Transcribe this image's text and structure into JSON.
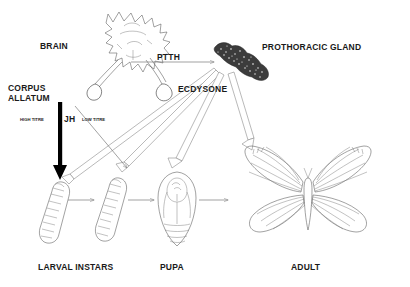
{
  "diagram": {
    "title_present": false,
    "background_color": "#ffffff",
    "ink_color": "#555555",
    "labels": {
      "brain": "BRAIN",
      "ptth": "PTTH",
      "prothoracic_gland": "PROTHORACIC GLAND",
      "ecdysone": "ECDYSONE",
      "corpus_allatum_line1": "CORPUS",
      "corpus_allatum_line2": "ALLATUM",
      "jh": "JH",
      "jh_high_titre": "HIGH TITRE",
      "jh_low_titre": "LOW TITRE",
      "larval_instars": "LARVAL INSTARS",
      "pupa": "PUPA",
      "adult": "ADULT"
    },
    "structures": [
      {
        "name": "brain",
        "type": "organ-drawing",
        "label": "BRAIN"
      },
      {
        "name": "prothoracic-gland",
        "type": "organ-drawing",
        "label": "PROTHORACIC GLAND"
      },
      {
        "name": "corpus-allatum",
        "type": "organ-drawing",
        "label": "CORPUS ALLATUM"
      }
    ],
    "life_stages": [
      {
        "name": "larva-1",
        "label": "LARVAL INSTARS"
      },
      {
        "name": "larva-2",
        "label": "LARVAL INSTARS"
      },
      {
        "name": "pupa",
        "label": "PUPA"
      },
      {
        "name": "adult",
        "label": "ADULT"
      }
    ],
    "hormone_arrows": [
      {
        "name": "ptth-arrow",
        "from": "brain",
        "to": "prothoracic-gland",
        "hormone": "PTTH",
        "style": "thin-line"
      },
      {
        "name": "ecdysone-arrow-larva-1",
        "from": "prothoracic-gland",
        "to": "larva-1",
        "hormone": "ECDYSONE",
        "style": "hollow"
      },
      {
        "name": "ecdysone-arrow-larva-2",
        "from": "prothoracic-gland",
        "to": "larva-2",
        "hormone": "ECDYSONE",
        "style": "hollow"
      },
      {
        "name": "ecdysone-arrow-pupa",
        "from": "prothoracic-gland",
        "to": "pupa",
        "hormone": "ECDYSONE",
        "style": "hollow"
      },
      {
        "name": "ecdysone-arrow-adult",
        "from": "prothoracic-gland",
        "to": "adult",
        "hormone": "ECDYSONE",
        "style": "hollow"
      },
      {
        "name": "jh-high-titre-arrow",
        "from": "corpus-allatum",
        "to": "larva-1",
        "hormone": "JH",
        "style": "thick-black",
        "titre": "HIGH TITRE"
      },
      {
        "name": "jh-low-titre-arrow",
        "from": "corpus-allatum",
        "to": "larva-2",
        "hormone": "JH",
        "style": "thin-line",
        "titre": "LOW TITRE"
      }
    ],
    "development_arrows": [
      {
        "name": "develop-larva1-to-larva2",
        "from": "larva-1",
        "to": "larva-2"
      },
      {
        "name": "develop-larva2-to-pupa",
        "from": "larva-2",
        "to": "pupa"
      },
      {
        "name": "develop-pupa-to-adult",
        "from": "pupa",
        "to": "adult"
      }
    ]
  }
}
